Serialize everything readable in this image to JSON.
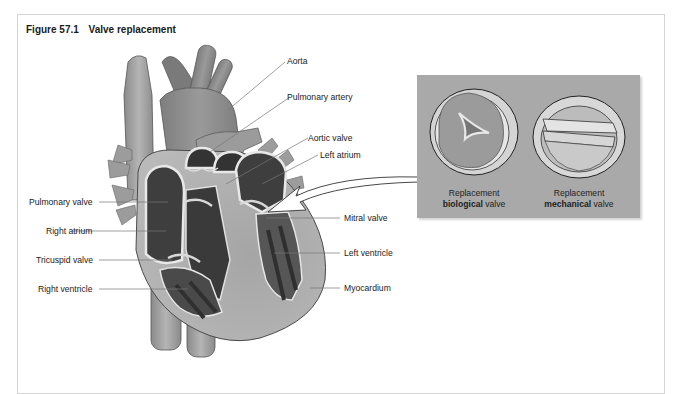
{
  "figure": {
    "number": "Figure 57.1",
    "title": "Valve replacement"
  },
  "labels_left": [
    {
      "id": "pulmonary-valve",
      "text": "Pulmonary valve"
    },
    {
      "id": "right-atrium",
      "text": "Right atrium"
    },
    {
      "id": "tricuspid-valve",
      "text": "Tricuspid valve"
    },
    {
      "id": "right-ventricle",
      "text": "Right ventricle"
    }
  ],
  "labels_right": [
    {
      "id": "aorta",
      "text": "Aorta"
    },
    {
      "id": "pulmonary-artery",
      "text": "Pulmonary artery"
    },
    {
      "id": "aortic-valve",
      "text": "Aortic valve"
    },
    {
      "id": "left-atrium",
      "text": "Left atrium"
    },
    {
      "id": "mitral-valve",
      "text": "Mitral valve"
    },
    {
      "id": "left-ventricle",
      "text": "Left ventricle"
    },
    {
      "id": "myocardium",
      "text": "Myocardium"
    }
  ],
  "inset": {
    "biological": {
      "line1": "Replacement",
      "bold": "biological",
      "rest": " valve"
    },
    "mechanical": {
      "line1": "Replacement",
      "bold": "mechanical",
      "rest": " valve"
    },
    "background_color": "#a9a9a9"
  },
  "colors": {
    "heart_dark": "#3c3c3c",
    "heart_mid": "#8a8a8a",
    "heart_light": "#b8b8b8",
    "vessel": "#999999",
    "leader_line": "#777777"
  }
}
